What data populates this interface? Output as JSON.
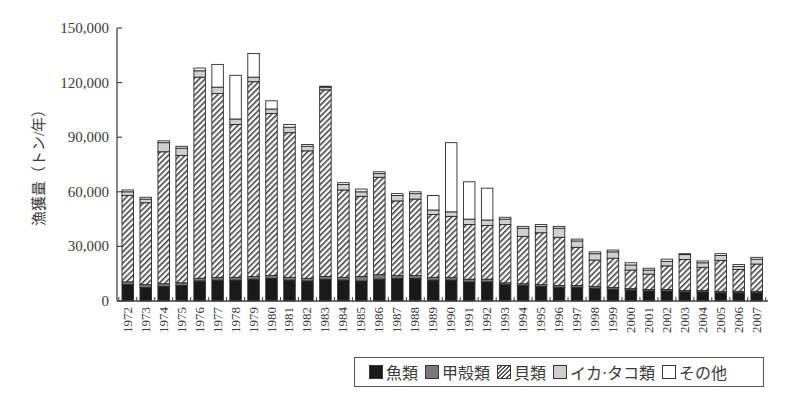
{
  "chart_data": {
    "type": "bar",
    "stacked": true,
    "title": "",
    "xlabel": "",
    "ylabel": "漁獲量（トン/年）",
    "ylim": [
      0,
      150000
    ],
    "yticks": [
      0,
      30000,
      60000,
      90000,
      120000,
      150000
    ],
    "ytick_labels": [
      "0",
      "30,000",
      "60,000",
      "90,000",
      "120,000",
      "150,000"
    ],
    "grid": false,
    "legend_position": "bottom-right",
    "categories": [
      "1972",
      "1973",
      "1974",
      "1975",
      "1976",
      "1977",
      "1978",
      "1979",
      "1980",
      "1981",
      "1982",
      "1983",
      "1984",
      "1985",
      "1986",
      "1987",
      "1988",
      "1989",
      "1990",
      "1991",
      "1992",
      "1993",
      "1994",
      "1995",
      "1996",
      "1997",
      "1998",
      "1999",
      "2000",
      "2001",
      "2002",
      "2003",
      "2004",
      "2005",
      "2006",
      "2007"
    ],
    "series": [
      {
        "name": "魚類",
        "key": "fish",
        "color": "#1a1a1a",
        "values": [
          9000,
          7500,
          8000,
          8500,
          11000,
          11500,
          11500,
          12000,
          12500,
          11500,
          11000,
          12000,
          11500,
          11000,
          12000,
          12500,
          12500,
          11500,
          11500,
          10500,
          10500,
          9000,
          8500,
          8000,
          7500,
          7500,
          7000,
          6500,
          6000,
          5500,
          5500,
          5000,
          5000,
          4500,
          4500,
          4500
        ]
      },
      {
        "name": "甲殻類",
        "key": "crust",
        "color": "#7a7a7a",
        "values": [
          1500,
          1500,
          1500,
          1500,
          1500,
          1500,
          1500,
          1500,
          1500,
          1500,
          1500,
          1500,
          1500,
          2500,
          2500,
          1500,
          1500,
          1500,
          1500,
          1500,
          1500,
          1000,
          1000,
          1000,
          1000,
          1000,
          1000,
          1000,
          800,
          800,
          800,
          800,
          800,
          800,
          800,
          800
        ]
      },
      {
        "name": "貝類",
        "key": "shell",
        "color": "hatch",
        "values": [
          47500,
          45000,
          72500,
          70000,
          110500,
          101000,
          84000,
          107000,
          89000,
          79500,
          70000,
          102500,
          48000,
          44000,
          53500,
          41000,
          42000,
          34500,
          33500,
          30000,
          29500,
          32000,
          26000,
          28500,
          26500,
          21000,
          14500,
          16000,
          10200,
          8500,
          13000,
          17000,
          12700,
          17000,
          12000,
          15000
        ]
      },
      {
        "name": "イカ・タコ類",
        "key": "squid",
        "color": "#cfcfcf",
        "values": [
          2000,
          2000,
          5000,
          4000,
          3500,
          3500,
          3000,
          2500,
          2500,
          3000,
          2500,
          1500,
          3000,
          2500,
          2000,
          3000,
          3000,
          2500,
          2500,
          3000,
          3000,
          3000,
          4500,
          3500,
          5000,
          3500,
          3500,
          3500,
          2800,
          2200,
          2500,
          2700,
          2500,
          2700,
          1700,
          2700
        ]
      },
      {
        "name": "その他",
        "key": "other",
        "color": "#ffffff",
        "values": [
          1000,
          1000,
          1000,
          1000,
          1500,
          12500,
          24000,
          13000,
          4500,
          1500,
          1000,
          500,
          1000,
          1500,
          1000,
          1000,
          1000,
          8000,
          38000,
          20500,
          17500,
          1000,
          1000,
          1000,
          1000,
          1000,
          1000,
          1000,
          1200,
          1000,
          1200,
          500,
          1000,
          1000,
          1000,
          1000
        ]
      }
    ],
    "totals_approx": [
      61000,
      57000,
      88000,
      85000,
      128000,
      130000,
      124000,
      136000,
      110000,
      97000,
      86000,
      118000,
      65000,
      61500,
      71000,
      59000,
      60000,
      58000,
      87000,
      65500,
      62000,
      46000,
      41000,
      42000,
      41000,
      34000,
      27000,
      28000,
      21000,
      18000,
      23000,
      26000,
      22000,
      26000,
      20000,
      24000
    ]
  },
  "legend": {
    "items": [
      {
        "label": "魚類",
        "swatch": "fish"
      },
      {
        "label": "甲殻類",
        "swatch": "crust"
      },
      {
        "label": "貝類",
        "swatch": "shell"
      },
      {
        "label": "イカ·タコ類",
        "swatch": "squid"
      },
      {
        "label": "その他",
        "swatch": "other"
      }
    ]
  }
}
